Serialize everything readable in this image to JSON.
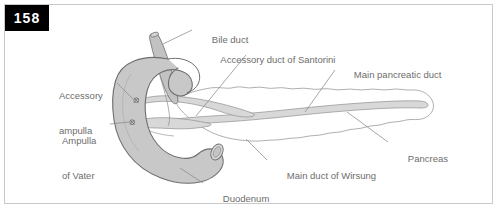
{
  "figure": {
    "page_badge": "158",
    "colors": {
      "badge_background": "#000000",
      "badge_text": "#ffffff",
      "frame_border": "#c9c9c9",
      "background": "#ffffff",
      "label_text": "#6d6d6d",
      "leader_line": "#8a8a8a",
      "duodenum_fill": "#c8c8c8",
      "duodenum_outline": "#6e6e6e",
      "bile_duct_fill": "#c2c2c2",
      "pancreas_fill": "#ffffff",
      "pancreas_outline": "#9a9a9a",
      "duct_fill": "#d8d8d8",
      "duct_outline": "#8f8f8f"
    },
    "labels": [
      {
        "name": "bile-duct",
        "lines": [
          "Bile duct"
        ],
        "x": 196,
        "y": 27,
        "align": "left"
      },
      {
        "name": "accessory-duct-santorini",
        "lines": [
          "Accessory duct of Santorini"
        ],
        "x": 205,
        "y": 47,
        "align": "left"
      },
      {
        "name": "main-pancreatic-duct",
        "lines": [
          "Main pancreatic duct"
        ],
        "x": 338,
        "y": 62,
        "align": "left"
      },
      {
        "name": "accessory-ampulla",
        "lines": [
          "Accessory",
          "ampulla"
        ],
        "x": 59,
        "y": 72,
        "align": "left"
      },
      {
        "name": "ampulla-of-vater",
        "lines": [
          "Ampulla",
          "of Vater"
        ],
        "x": 62,
        "y": 117,
        "align": "left"
      },
      {
        "name": "pancreas",
        "lines": [
          "Pancreas"
        ],
        "x": 392,
        "y": 146,
        "align": "left"
      },
      {
        "name": "main-duct-of-wirsung",
        "lines": [
          "Main duct of Wirsung"
        ],
        "x": 271,
        "y": 163,
        "align": "left"
      },
      {
        "name": "duodenum",
        "lines": [
          "Duodenum"
        ],
        "x": 207,
        "y": 186,
        "align": "left"
      }
    ],
    "structures": [
      {
        "name": "duodenum",
        "description": "C-shaped loop of duodenum, gray tube, open cut end lower right"
      },
      {
        "name": "bile-duct",
        "description": "Tapered gray tube descending from upper left into duodenal wall"
      },
      {
        "name": "pancreas",
        "description": "Lobulated scalloped gland extending right from duodenal loop to tail"
      },
      {
        "name": "main-pancreatic-duct",
        "description": "Duct of Wirsung running through pancreas to ampulla of Vater"
      },
      {
        "name": "accessory-duct",
        "description": "Duct of Santorini branching to accessory ampulla"
      },
      {
        "name": "ampulla-of-vater-marker",
        "description": "Small marker on inner duodenal wall, lower"
      },
      {
        "name": "accessory-ampulla-marker",
        "description": "Small marker on inner duodenal wall, upper"
      }
    ]
  }
}
